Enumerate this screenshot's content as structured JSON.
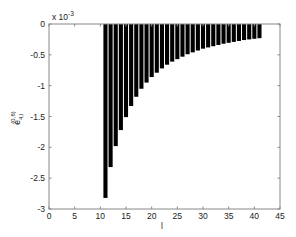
{
  "chart_data": {
    "type": "bar",
    "title": "",
    "xlabel": "l",
    "ylabel": "e_{4,l}^{(0,8)}",
    "y_multiplier": "x 10^-3",
    "xlim": [
      0,
      45
    ],
    "ylim": [
      -3,
      0
    ],
    "xticks": [
      "0",
      "5",
      "10",
      "15",
      "20",
      "25",
      "30",
      "35",
      "40",
      "45"
    ],
    "yticks": [
      "0",
      "-0.5",
      "-1",
      "-1.5",
      "-2",
      "-2.5",
      "-3"
    ],
    "grid": false,
    "legend": null,
    "x": [
      11,
      12,
      13,
      14,
      15,
      16,
      17,
      18,
      19,
      20,
      21,
      22,
      23,
      24,
      25,
      26,
      27,
      28,
      29,
      30,
      31,
      32,
      33,
      34,
      35,
      36,
      37,
      38,
      39,
      40,
      41
    ],
    "values": [
      -2.82,
      -2.32,
      -1.98,
      -1.72,
      -1.51,
      -1.33,
      -1.18,
      -1.05,
      -0.95,
      -0.86,
      -0.79,
      -0.72,
      -0.66,
      -0.61,
      -0.57,
      -0.53,
      -0.49,
      -0.46,
      -0.43,
      -0.4,
      -0.38,
      -0.36,
      -0.34,
      -0.32,
      -0.305,
      -0.29,
      -0.275,
      -0.26,
      -0.25,
      -0.24,
      -0.23
    ],
    "bar_color": "#000000"
  },
  "axes": {
    "multiplier_label": "x 10",
    "multiplier_exp": "-3",
    "xlabel": "l",
    "ylabel_main": "e",
    "ylabel_sub": "4,l",
    "ylabel_sup": "(0,8)"
  }
}
